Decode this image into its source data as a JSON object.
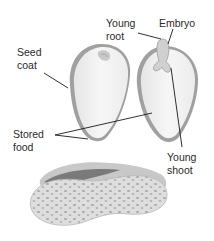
{
  "diagram": {
    "labels": {
      "young_root": "Young\nroot",
      "embryo": "Embryo",
      "seed_coat": "Seed\ncoat",
      "stored_food": "Stored\nfood",
      "young_shoot": "Young\nshoot"
    },
    "colors": {
      "background": "#ffffff",
      "seed_fill": "#f2f2f2",
      "seed_coat_edge": "#9a9a9a",
      "shell_fill": "#dcdcdc",
      "shell_spots": "#a8a8a8",
      "leader_line": "#1a1a1a",
      "text": "#2a2a2a"
    }
  }
}
